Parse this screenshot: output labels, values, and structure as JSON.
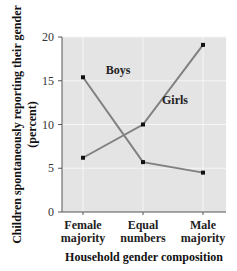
{
  "chart_data": {
    "type": "line",
    "title": "",
    "xlabel": "Household gender composition",
    "ylabel": "Children spontaneously reporting their gender (percent)",
    "ylabel_lines": [
      "Children spontaneously reporting their gender",
      "(percent)"
    ],
    "categories": [
      "Female majority",
      "Equal numbers",
      "Male majority"
    ],
    "category_lines": [
      [
        "Female",
        "majority"
      ],
      [
        "Equal",
        "numbers"
      ],
      [
        "Male",
        "majority"
      ]
    ],
    "yticks": [
      0,
      5,
      10,
      15,
      20
    ],
    "ylim": [
      0,
      20
    ],
    "grid": true,
    "legend": "inline labels",
    "series": [
      {
        "name": "Boys",
        "values": [
          15.4,
          5.7,
          4.5
        ],
        "label_pos": [
          118,
          74
        ]
      },
      {
        "name": "Girls",
        "values": [
          6.2,
          10.0,
          19.1
        ],
        "label_pos": [
          175,
          104
        ]
      }
    ],
    "colors": {
      "plot_bg": "#e4e4e4",
      "grid": "#f5f5f5",
      "line": "#808080",
      "marker": "#111111",
      "axis": "#555555"
    }
  }
}
